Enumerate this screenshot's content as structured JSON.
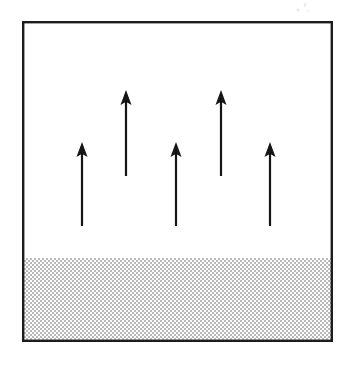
{
  "figure": {
    "canvas": {
      "width": 353,
      "height": 368,
      "background": "#ffffff"
    },
    "frame": {
      "name": "outer box",
      "x": 22,
      "y": 21,
      "width": 311,
      "height": 321,
      "stroke": "#1a1a1a",
      "stroke_width": 2.4,
      "fill": "#ffffff"
    },
    "shaded_region": {
      "name": "stippled ground band",
      "x": 23,
      "y": 258,
      "width": 309,
      "height": 83,
      "pattern": "fine checkerboard dither",
      "cell_size": 2,
      "dot_color": "#b9b9b9",
      "background": "#ffffff",
      "top_edge_y": 258
    },
    "arrows": [
      {
        "id": "arrow-1",
        "x": 82,
        "tip_y": 142,
        "tail_y": 226,
        "length": 84,
        "shaft_width": 2.2,
        "head_width": 11,
        "head_height": 15,
        "color": "#121212"
      },
      {
        "id": "arrow-2",
        "x": 126,
        "tip_y": 90,
        "tail_y": 176,
        "length": 86,
        "shaft_width": 2.2,
        "head_width": 11,
        "head_height": 15,
        "color": "#121212"
      },
      {
        "id": "arrow-3",
        "x": 176,
        "tip_y": 142,
        "tail_y": 226,
        "length": 84,
        "shaft_width": 2.2,
        "head_width": 11,
        "head_height": 15,
        "color": "#121212"
      },
      {
        "id": "arrow-4",
        "x": 221,
        "tip_y": 90,
        "tail_y": 176,
        "length": 86,
        "shaft_width": 2.2,
        "head_width": 11,
        "head_height": 15,
        "color": "#121212"
      },
      {
        "id": "arrow-5",
        "x": 270,
        "tip_y": 142,
        "tail_y": 226,
        "length": 84,
        "shaft_width": 2.2,
        "head_width": 11,
        "head_height": 15,
        "color": "#121212"
      }
    ],
    "artifact": {
      "name": "scan smudge",
      "x": 294,
      "y": 1,
      "width": 20,
      "height": 14
    },
    "colors": {
      "ink": "#121212",
      "frame_stroke": "#1a1a1a",
      "shading_dot": "#b9b9b9",
      "paper": "#ffffff"
    }
  }
}
